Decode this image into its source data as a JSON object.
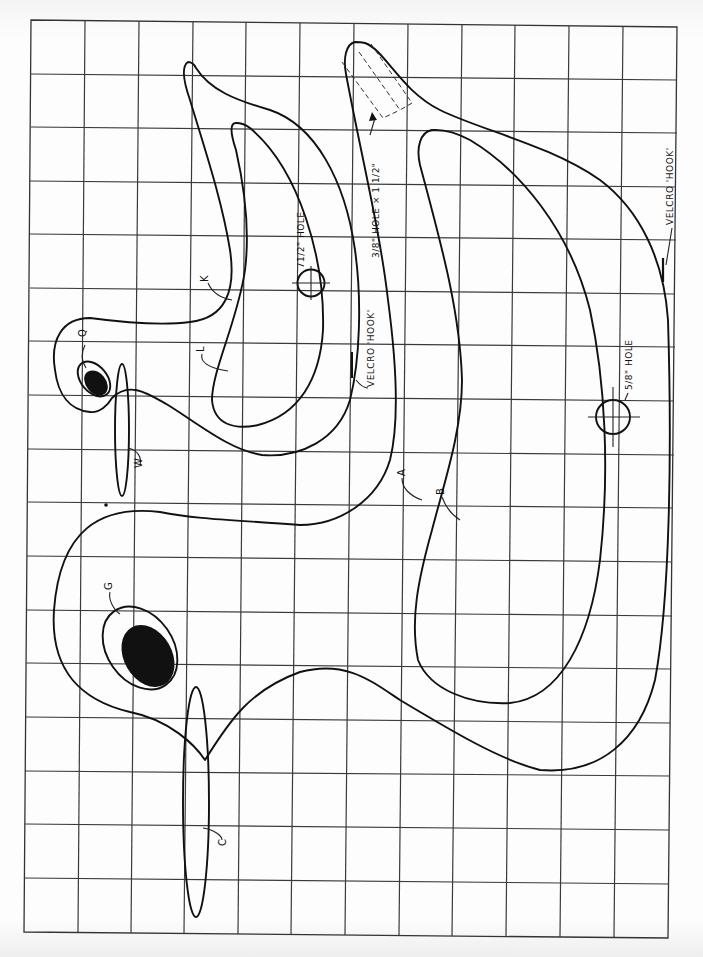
{
  "pattern": {
    "grid": {
      "columns": 12,
      "rows": 17,
      "line_color": "#3a3a3a"
    },
    "parts": [
      {
        "id": "A",
        "label": "A",
        "description": "large goose body outline"
      },
      {
        "id": "B",
        "label": "B",
        "description": "large goose wing cut-out"
      },
      {
        "id": "C",
        "label": "C",
        "description": "large goose bill"
      },
      {
        "id": "G",
        "label": "G",
        "description": "large goose eye"
      },
      {
        "id": "K",
        "label": "K",
        "description": "small goose body outline"
      },
      {
        "id": "L",
        "label": "L",
        "description": "small goose wing cut-out"
      },
      {
        "id": "Q",
        "label": "Q",
        "description": "small goose eye"
      },
      {
        "id": "W",
        "label": "W",
        "description": "small goose bill"
      }
    ],
    "annotations": {
      "hole_half": "1/2\" HOLE",
      "hole_slot": "3/8\" HOLE × 1 1/2\"",
      "hole_five_eighths": "5/8\" HOLE",
      "velcro_inner": "VELCRO 'HOOK'",
      "velcro_outer": "VELCRO 'HOOK'"
    },
    "colors": {
      "ink": "#111111",
      "paper": "#fdfdfd"
    }
  }
}
